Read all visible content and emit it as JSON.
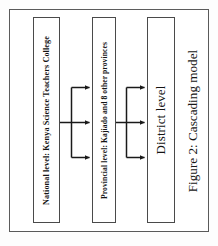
{
  "figure": {
    "caption": "Figure 2: Cascading model",
    "boxes": [
      {
        "id": "national",
        "label": "National level: Kenya Science Teachers College"
      },
      {
        "id": "provincial",
        "label": "Provincial level: Kajiado and 8 other provinces"
      },
      {
        "id": "district",
        "label": "District level"
      }
    ],
    "connectors": [
      {
        "from": "national",
        "to": "provincial",
        "branches": 3,
        "direction": "right"
      },
      {
        "from": "provincial",
        "to": "district",
        "branches": 3,
        "direction": "right"
      }
    ],
    "colors": {
      "frame": "#5a5a5a",
      "box_border": "#4a4a4a",
      "arrow": "#1a1a1a",
      "text": "#141414",
      "background": "#ffffff"
    }
  }
}
